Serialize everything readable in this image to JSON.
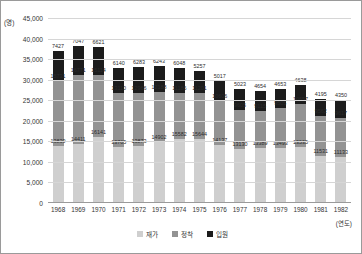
{
  "axes": {
    "y_unit": "(명)",
    "x_unit": "(연도)",
    "y_ticks": [
      "45,000",
      "40,000",
      "35,000",
      "30,000",
      "25,000",
      "20,000",
      "15,000",
      "10,000",
      "5,000",
      "0"
    ]
  },
  "legend": {
    "items": [
      {
        "label": "재가",
        "color": "#cfcfcf"
      },
      {
        "label": "정착",
        "color": "#939393"
      },
      {
        "label": "입원",
        "color": "#1c1c1c"
      }
    ]
  },
  "chart_data": {
    "type": "bar",
    "title": "",
    "xlabel": "(연도)",
    "ylabel": "(명)",
    "ylim": [
      0,
      45000
    ],
    "stacked": true,
    "grid": true,
    "legend_position": "bottom",
    "categories": [
      "1968",
      "1969",
      "1970",
      "1971",
      "1972",
      "1973",
      "1974",
      "1975",
      "1976",
      "1977",
      "1978",
      "1979",
      "1980",
      "1981",
      "1982"
    ],
    "series": [
      {
        "name": "재가",
        "color": "#cfcfcf",
        "values": [
          13839,
          14411,
          16141,
          13705,
          13873,
          14902,
          15582,
          15644,
          14137,
          13130,
          13389,
          13493,
          13535,
          11531,
          11133
        ]
      },
      {
        "name": "정착",
        "color": "#939393",
        "values": [
          15731,
          16771,
          15114,
          13110,
          12966,
          12188,
          11186,
          11201,
          10606,
          9605,
          9115,
          9505,
          10657,
          9562,
          9617
        ]
      },
      {
        "name": "입원",
        "color": "#1c1c1c",
        "values": [
          7427,
          7047,
          6621,
          6140,
          6283,
          6243,
          6048,
          5257,
          5017,
          5023,
          4654,
          4653,
          4638,
          4195,
          4350
        ]
      }
    ]
  }
}
